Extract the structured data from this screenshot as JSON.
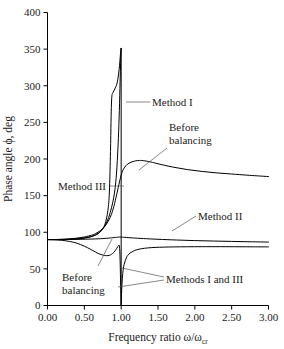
{
  "chart_data": {
    "type": "line",
    "title": "",
    "xlabel": "Frequency ratio ω/ω",
    "xlabel_sub": "cr",
    "ylabel": "Phase angle ϕ, deg",
    "xlim": [
      0,
      3
    ],
    "ylim": [
      0,
      400
    ],
    "grid": false,
    "legend_position": "inline-annotations",
    "xticks": [
      "0.00",
      "0.50",
      "1.00",
      "1.50",
      "2.00",
      "2.50",
      "3.00"
    ],
    "xtick_values": [
      0,
      0.5,
      1,
      1.5,
      2,
      2.5,
      3
    ],
    "yticks": [
      "0",
      "50",
      "100",
      "150",
      "200",
      "250",
      "300",
      "350",
      "400"
    ],
    "ytick_values": [
      0,
      50,
      100,
      150,
      200,
      250,
      300,
      350,
      400
    ],
    "series": [
      {
        "name": "Before balancing (upper)",
        "label": "Before balancing",
        "x": [
          0.0,
          0.1,
          0.2,
          0.3,
          0.4,
          0.5,
          0.6,
          0.65,
          0.7,
          0.75,
          0.8,
          0.85,
          0.88,
          0.9,
          0.92,
          0.94,
          0.96,
          0.98,
          1.0,
          1.02,
          1.05,
          1.08,
          1.12,
          1.16,
          1.2,
          1.25,
          1.3,
          1.4,
          1.5,
          1.7,
          1.9,
          2.1,
          2.3,
          2.5,
          2.7,
          2.85,
          3.0
        ],
        "y": [
          90,
          90,
          90.5,
          91,
          92,
          93.5,
          96,
          98,
          101,
          105,
          111,
          120,
          128,
          135,
          143,
          152,
          161,
          170,
          178,
          184,
          189,
          192.5,
          195,
          196.5,
          197.5,
          198,
          197.8,
          196,
          193.5,
          189,
          185.5,
          183,
          181,
          179.5,
          178,
          177,
          176
        ]
      },
      {
        "name": "Method I",
        "label": "Method I",
        "x": [
          0.0,
          0.2,
          0.4,
          0.55,
          0.65,
          0.72,
          0.78,
          0.82,
          0.84,
          0.855,
          0.862,
          0.868,
          0.875,
          0.885,
          0.9,
          0.92,
          0.94,
          0.955,
          0.965,
          0.972,
          0.978,
          0.983,
          0.987,
          0.99,
          0.993,
          0.995,
          0.9965,
          0.998,
          0.9995
        ],
        "y": [
          90,
          90,
          91,
          93,
          96,
          101,
          111,
          130,
          155,
          210,
          250,
          275,
          287,
          290,
          293,
          297,
          302,
          309,
          316,
          322,
          328,
          334,
          339,
          343,
          347,
          349,
          350.5,
          351,
          351
        ]
      },
      {
        "name": "Method III (upper rise)",
        "label": "Method III",
        "x": [
          0.0,
          0.2,
          0.4,
          0.55,
          0.65,
          0.72,
          0.78,
          0.83,
          0.87,
          0.9,
          0.92,
          0.935,
          0.948,
          0.958,
          0.966,
          0.972,
          0.978,
          0.983,
          0.987,
          0.991,
          0.994,
          0.9965,
          0.998,
          0.9995
        ],
        "y": [
          90,
          90,
          91,
          93,
          96.5,
          101,
          109,
          120,
          134,
          148,
          162,
          178,
          198,
          218,
          238,
          256,
          276,
          296,
          312,
          327,
          339,
          345,
          349,
          351
        ]
      },
      {
        "name": "Before balancing (lower dip)",
        "label": "Before balancing",
        "x": [
          0.0,
          0.1,
          0.2,
          0.3,
          0.4,
          0.5,
          0.58,
          0.65,
          0.7,
          0.75,
          0.8,
          0.84,
          0.87,
          0.9,
          0.92,
          0.94,
          0.955,
          0.965,
          0.972,
          0.978,
          0.983,
          0.988,
          0.992,
          0.996,
          0.999
        ],
        "y": [
          90,
          89.8,
          89,
          87.5,
          85,
          81,
          77,
          73,
          70.5,
          68.8,
          68,
          68.5,
          70,
          72.5,
          75,
          78,
          80.5,
          82,
          82.5,
          80,
          70,
          52,
          32,
          12,
          0
        ]
      },
      {
        "name": "Method II",
        "label": "Method II",
        "x": [
          0.0,
          0.2,
          0.4,
          0.55,
          0.65,
          0.72,
          0.78,
          0.83,
          0.87,
          0.9,
          0.92,
          0.94,
          0.955,
          0.965,
          0.975,
          0.985,
          1.0,
          1.05,
          1.15,
          1.3,
          1.5,
          1.75,
          2.0,
          2.25,
          2.5,
          2.75,
          3.0
        ],
        "y": [
          90,
          90.1,
          90.3,
          90.6,
          90.9,
          91.2,
          91.6,
          92,
          92.4,
          92.7,
          92.9,
          93.1,
          93.3,
          93.4,
          93.5,
          93.5,
          93.3,
          93,
          92.3,
          91.4,
          90.4,
          89.4,
          88.6,
          88,
          87.5,
          87,
          86.6
        ]
      },
      {
        "name": "Methods I and III (lower branch)",
        "label": "Methods I and III",
        "x": [
          1.0005,
          1.002,
          1.004,
          1.007,
          1.011,
          1.016,
          1.022,
          1.03,
          1.04,
          1.055,
          1.07,
          1.09,
          1.12,
          1.16,
          1.21,
          1.28,
          1.36,
          1.46,
          1.58,
          1.72,
          1.9,
          2.1,
          2.35,
          2.6,
          2.8,
          3.0
        ],
        "y": [
          0,
          6,
          13,
          21,
          29,
          37,
          44,
          51,
          56,
          61,
          65,
          68.5,
          71.5,
          74,
          76,
          77.6,
          78.6,
          79.3,
          79.7,
          80,
          80.2,
          80.3,
          80.3,
          80.2,
          80.1,
          80
        ]
      },
      {
        "name": "Resonance vertical (x=1)",
        "label": "",
        "x": [
          1.0,
          1.0
        ],
        "y": [
          0,
          351
        ]
      }
    ],
    "annotations": [
      {
        "id": "method-1",
        "text": "Method I",
        "x": 1.25,
        "y": 268
      },
      {
        "id": "before-balancing-upper",
        "text_line1": "Before",
        "text_line2": "balancing",
        "x": 1.55,
        "y": 225
      },
      {
        "id": "method-3",
        "text": "Method III",
        "x": 0.18,
        "y": 150
      },
      {
        "id": "method-2",
        "text": "Method II",
        "x": 2.05,
        "y": 110
      },
      {
        "id": "before-balancing-lower",
        "text_line1": "Before",
        "text_line2": "balancing",
        "x": 0.45,
        "y": 40
      },
      {
        "id": "methods-1-and-3",
        "text": "Methods I and III",
        "x": 1.62,
        "y": 38
      }
    ],
    "colors": {
      "curve": "#000000",
      "axis": "#000000",
      "text": "#1a1a1a",
      "leader": "#555555",
      "background": "#ffffff"
    }
  }
}
